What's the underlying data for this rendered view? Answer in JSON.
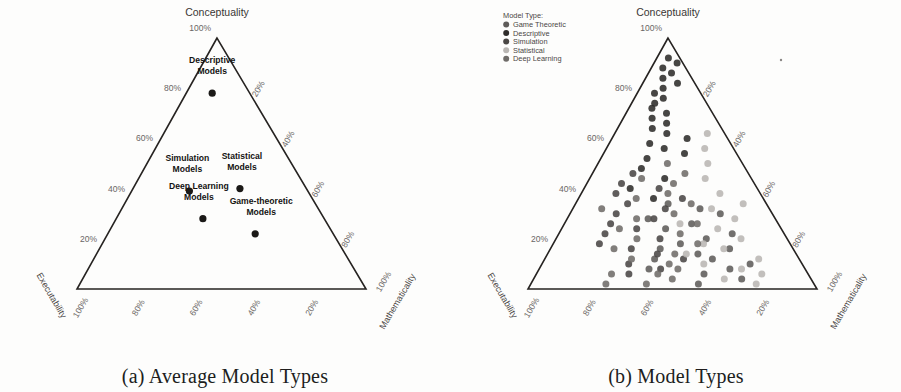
{
  "figure": {
    "panels": [
      {
        "id": "a",
        "caption": "(a) Average Model Types",
        "apex_label": "Conceptuality",
        "left_axis_label": "Executability",
        "right_axis_label": "Mathematicality",
        "apex_tick": "100%",
        "left_ticks": [
          "20%",
          "40%",
          "60%",
          "80%"
        ],
        "right_ticks": [
          "20%",
          "40%",
          "60%",
          "80%"
        ],
        "bottom_ticks": [
          "100%",
          "80%",
          "60%",
          "40%",
          "20%"
        ],
        "bottom_left_corner_tick": "100%",
        "bottom_right_corner_tick": "100%",
        "points": [
          {
            "label_line1": "Descriptive",
            "label_line2": "Models",
            "conceptuality": 78,
            "executability": 13,
            "mathematicality": 9,
            "color": "#1b1917"
          },
          {
            "label_line1": "Simulation",
            "label_line2": "Models",
            "conceptuality": 39,
            "executability": 41,
            "mathematicality": 20,
            "color": "#1b1917"
          },
          {
            "label_line1": "Statistical",
            "label_line2": "Models",
            "conceptuality": 40,
            "executability": 23,
            "mathematicality": 37,
            "color": "#1b1917"
          },
          {
            "label_line1": "Deep Learning",
            "label_line2": "Models",
            "conceptuality": 28,
            "executability": 42,
            "mathematicality": 30,
            "color": "#1b1917"
          },
          {
            "label_line1": "Game-theoretic",
            "label_line2": "Models",
            "conceptuality": 22,
            "executability": 27,
            "mathematicality": 51,
            "color": "#1b1917"
          }
        ]
      },
      {
        "id": "b",
        "caption": "(b) Model Types",
        "apex_label": "Conceptuality",
        "left_axis_label": "Executability",
        "right_axis_label": "Mathematicality",
        "apex_tick": "100%",
        "left_ticks": [
          "20%",
          "40%",
          "60%",
          "80%"
        ],
        "right_ticks": [
          "20%",
          "40%",
          "60%",
          "80%"
        ],
        "bottom_ticks": [
          "100%",
          "80%",
          "60%",
          "40%",
          "20%"
        ],
        "bottom_left_corner_tick": "100%",
        "bottom_right_corner_tick": "100%",
        "legend": {
          "title": "Model Type:",
          "entries": [
            {
              "label": "Game Theoretic",
              "color": "#5f5c5a"
            },
            {
              "label": "Descriptive",
              "color": "#2e2c2a"
            },
            {
              "label": "Simulation",
              "color": "#4a4745"
            },
            {
              "label": "Statistical",
              "color": "#b9b6b3"
            },
            {
              "label": "Deep Learning",
              "color": "#6f6c69"
            }
          ]
        }
      }
    ]
  },
  "chart_data": [
    {
      "type": "scatter",
      "subtype": "ternary",
      "title": "(a) Average Model Types",
      "axes": {
        "top": "Conceptuality",
        "left": "Executability",
        "right": "Mathematicality"
      },
      "tick_labels": [
        "20%",
        "40%",
        "60%",
        "80%",
        "100%"
      ],
      "grid": false,
      "legend": "none",
      "annotations": [
        "Descriptive Models",
        "Simulation Models",
        "Statistical Models",
        "Deep Learning Models",
        "Game-theoretic Models"
      ],
      "points": [
        {
          "name": "Descriptive Models",
          "conceptuality": 78,
          "executability": 13,
          "mathematicality": 9
        },
        {
          "name": "Simulation Models",
          "conceptuality": 39,
          "executability": 41,
          "mathematicality": 20
        },
        {
          "name": "Statistical Models",
          "conceptuality": 40,
          "executability": 23,
          "mathematicality": 37
        },
        {
          "name": "Deep Learning Models",
          "conceptuality": 28,
          "executability": 42,
          "mathematicality": 30
        },
        {
          "name": "Game-theoretic Models",
          "conceptuality": 22,
          "executability": 27,
          "mathematicality": 51
        }
      ]
    },
    {
      "type": "scatter",
      "subtype": "ternary",
      "title": "(b) Model Types",
      "axes": {
        "top": "Conceptuality",
        "left": "Executability",
        "right": "Mathematicality"
      },
      "tick_labels": [
        "20%",
        "40%",
        "60%",
        "80%",
        "100%"
      ],
      "grid": false,
      "legend": "top-left",
      "series": [
        {
          "name": "Game Theoretic",
          "color": "#5f5c5a",
          "points": [
            [
              20,
              28,
              52
            ],
            [
              16,
              22,
              62
            ],
            [
              14,
              34,
              52
            ],
            [
              26,
              30,
              44
            ],
            [
              32,
              24,
              44
            ],
            [
              12,
              30,
              58
            ],
            [
              22,
              18,
              60
            ],
            [
              8,
              26,
              66
            ],
            [
              18,
              38,
              44
            ],
            [
              30,
              18,
              52
            ],
            [
              10,
              18,
              72
            ],
            [
              24,
              40,
              36
            ],
            [
              6,
              36,
              58
            ],
            [
              16,
              46,
              38
            ],
            [
              34,
              34,
              32
            ],
            [
              4,
              24,
              72
            ],
            [
              12,
              50,
              38
            ],
            [
              28,
              44,
              28
            ],
            [
              8,
              54,
              38
            ],
            [
              2,
              40,
              58
            ]
          ]
        },
        {
          "name": "Descriptive",
          "color": "#2e2c2a",
          "points": [
            [
              92,
              4,
              4
            ],
            [
              88,
              8,
              4
            ],
            [
              84,
              10,
              6
            ],
            [
              80,
              12,
              8
            ],
            [
              78,
              16,
              6
            ],
            [
              76,
              14,
              10
            ],
            [
              74,
              18,
              8
            ],
            [
              82,
              6,
              12
            ],
            [
              86,
              6,
              8
            ],
            [
              72,
              20,
              8
            ],
            [
              70,
              16,
              14
            ],
            [
              68,
              22,
              10
            ],
            [
              66,
              18,
              16
            ],
            [
              64,
              24,
              12
            ],
            [
              62,
              20,
              18
            ],
            [
              58,
              28,
              14
            ],
            [
              56,
              24,
              20
            ],
            [
              52,
              32,
              16
            ],
            [
              60,
              14,
              26
            ],
            [
              54,
              18,
              28
            ],
            [
              48,
              36,
              16
            ],
            [
              44,
              30,
              26
            ],
            [
              40,
              44,
              16
            ],
            [
              36,
              38,
              26
            ],
            [
              90,
              2,
              8
            ]
          ]
        },
        {
          "name": "Simulation",
          "color": "#4a4745",
          "points": [
            [
              46,
              40,
              14
            ],
            [
              42,
              46,
              12
            ],
            [
              38,
              50,
              12
            ],
            [
              34,
              48,
              18
            ],
            [
              30,
              54,
              16
            ],
            [
              26,
              58,
              16
            ],
            [
              22,
              62,
              16
            ],
            [
              18,
              66,
              16
            ],
            [
              28,
              42,
              30
            ],
            [
              24,
              50,
              26
            ],
            [
              20,
              44,
              36
            ],
            [
              16,
              56,
              28
            ],
            [
              32,
              36,
              32
            ],
            [
              14,
              48,
              38
            ],
            [
              10,
              60,
              30
            ],
            [
              12,
              40,
              48
            ],
            [
              36,
              28,
              36
            ],
            [
              8,
              50,
              42
            ],
            [
              6,
              62,
              32
            ],
            [
              40,
              34,
              26
            ]
          ]
        },
        {
          "name": "Statistical",
          "color": "#b9b6b3",
          "points": [
            [
              62,
              6,
              32
            ],
            [
              56,
              10,
              34
            ],
            [
              50,
              12,
              38
            ],
            [
              44,
              16,
              40
            ],
            [
              38,
              14,
              48
            ],
            [
              32,
              20,
              48
            ],
            [
              28,
              14,
              58
            ],
            [
              24,
              22,
              54
            ],
            [
              20,
              16,
              64
            ],
            [
              16,
              24,
              60
            ],
            [
              12,
              14,
              74
            ],
            [
              8,
              22,
              70
            ],
            [
              34,
              8,
              58
            ],
            [
              26,
              34,
              40
            ],
            [
              18,
              30,
              52
            ],
            [
              10,
              34,
              56
            ],
            [
              6,
              16,
              78
            ],
            [
              4,
              30,
              66
            ],
            [
              2,
              20,
              78
            ],
            [
              14,
              38,
              48
            ]
          ]
        },
        {
          "name": "Deep Learning",
          "color": "#6f6c69",
          "points": [
            [
              50,
              26,
              24
            ],
            [
              46,
              22,
              32
            ],
            [
              42,
              28,
              30
            ],
            [
              38,
              32,
              30
            ],
            [
              34,
              26,
              40
            ],
            [
              30,
              34,
              36
            ],
            [
              26,
              28,
              46
            ],
            [
              22,
              36,
              42
            ],
            [
              18,
              32,
              50
            ],
            [
              14,
              42,
              44
            ],
            [
              10,
              46,
              44
            ],
            [
              28,
              48,
              24
            ],
            [
              24,
              56,
              20
            ],
            [
              20,
              52,
              28
            ],
            [
              16,
              62,
              22
            ],
            [
              12,
              58,
              30
            ],
            [
              8,
              44,
              48
            ],
            [
              6,
              52,
              42
            ],
            [
              4,
              48,
              48
            ],
            [
              2,
              58,
              40
            ],
            [
              44,
              38,
              18
            ],
            [
              36,
              44,
              20
            ],
            [
              32,
              58,
              10
            ],
            [
              6,
              68,
              26
            ],
            [
              2,
              72,
              26
            ]
          ]
        }
      ]
    }
  ]
}
